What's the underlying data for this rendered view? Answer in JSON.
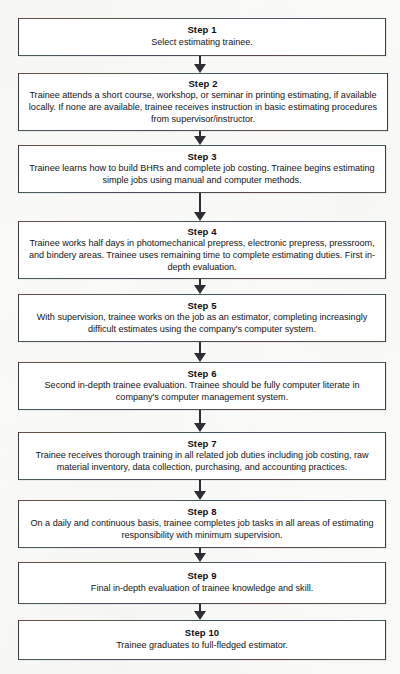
{
  "diagram": {
    "type": "flowchart",
    "orientation": "vertical",
    "connector_count": 9,
    "colors": {
      "box_border": "#3a3a40",
      "box_fill": "#ffffff",
      "arrow": "#2e2e34",
      "text": "#141418",
      "page": "#fdfdfb"
    },
    "steps": [
      {
        "id": "step-1",
        "title": "Step 1",
        "body": "Select estimating trainee."
      },
      {
        "id": "step-2",
        "title": "Step 2",
        "body": "Trainee attends a short course, workshop, or seminar in printing estimating, if available locally. If none are available, trainee receives instruction in basic estimating procedures from supervisor/instructor."
      },
      {
        "id": "step-3",
        "title": "Step 3",
        "body": "Trainee learns how to build BHRs and complete job costing. Trainee begins estimating simple jobs using manual and computer methods."
      },
      {
        "id": "step-4",
        "title": "Step 4",
        "body": "Trainee works half days in photomechanical prepress, electronic prepress, pressroom, and bindery areas. Trainee uses remaining time to complete estimating duties. First in-depth evaluation."
      },
      {
        "id": "step-5",
        "title": "Step 5",
        "body": "With supervision, trainee works on the job as an estimator, completing increasingly difficult estimates using the company's computer system."
      },
      {
        "id": "step-6",
        "title": "Step 6",
        "body": "Second in-depth trainee evaluation. Trainee should be fully computer literate in company's computer management system."
      },
      {
        "id": "step-7",
        "title": "Step 7",
        "body": "Trainee receives thorough training in all related job duties including job costing, raw material inventory, data collection, purchasing, and accounting practices."
      },
      {
        "id": "step-8",
        "title": "Step 8",
        "body": "On a daily and continuous basis, trainee completes job tasks in all areas of estimating responsibility with minimum supervision."
      },
      {
        "id": "step-9",
        "title": "Step 9",
        "body": "Final in-depth evaluation of trainee knowledge and skill."
      },
      {
        "id": "step-10",
        "title": "Step 10",
        "body": "Trainee graduates to full-fledged estimator."
      }
    ]
  },
  "layout": {
    "boxes": [
      {
        "left": 18,
        "top": 18,
        "width": 368,
        "height": 38
      },
      {
        "left": 18,
        "top": 73,
        "width": 370,
        "height": 58
      },
      {
        "left": 18,
        "top": 145,
        "width": 368,
        "height": 48
      },
      {
        "left": 18,
        "top": 221,
        "width": 368,
        "height": 58
      },
      {
        "left": 18,
        "top": 294,
        "width": 368,
        "height": 48
      },
      {
        "left": 18,
        "top": 362,
        "width": 368,
        "height": 48
      },
      {
        "left": 18,
        "top": 432,
        "width": 368,
        "height": 48
      },
      {
        "left": 18,
        "top": 500,
        "width": 368,
        "height": 48
      },
      {
        "left": 18,
        "top": 562,
        "width": 368,
        "height": 42
      },
      {
        "left": 18,
        "top": 620,
        "width": 368,
        "height": 40
      }
    ],
    "arrows": [
      {
        "top": 56,
        "height": 17,
        "stem": 8
      },
      {
        "top": 131,
        "height": 14,
        "stem": 5
      },
      {
        "top": 193,
        "height": 28,
        "stem": 19
      },
      {
        "top": 279,
        "height": 15,
        "stem": 6
      },
      {
        "top": 342,
        "height": 20,
        "stem": 11
      },
      {
        "top": 410,
        "height": 22,
        "stem": 13
      },
      {
        "top": 480,
        "height": 20,
        "stem": 11
      },
      {
        "top": 548,
        "height": 14,
        "stem": 5
      },
      {
        "top": 604,
        "height": 16,
        "stem": 7
      }
    ],
    "arrow_center_x": 200
  }
}
